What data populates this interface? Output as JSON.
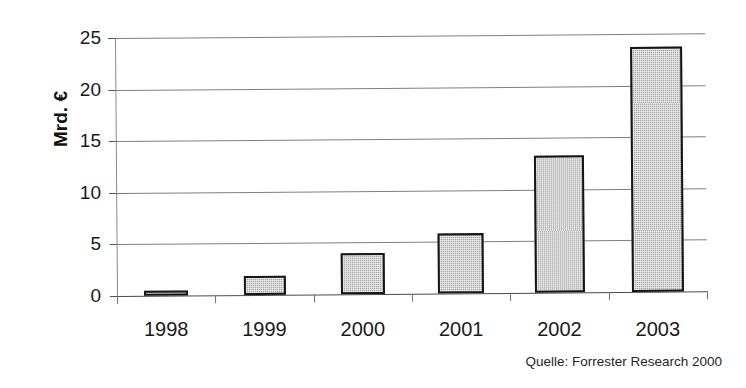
{
  "chart_data": {
    "type": "bar",
    "title": "",
    "subtitle": "",
    "xlabel": "",
    "ylabel": "Mrd. €",
    "categories": [
      "1998",
      "1999",
      "2000",
      "2001",
      "2002",
      "2003"
    ],
    "values": [
      0.5,
      1.8,
      4.0,
      5.8,
      13.3,
      23.7
    ],
    "series": [
      {
        "name": "",
        "values": [
          0.5,
          1.8,
          4.0,
          5.8,
          13.3,
          23.7
        ]
      }
    ],
    "ylim": [
      0,
      25
    ],
    "y_ticks": [
      0,
      5,
      10,
      15,
      20,
      25
    ],
    "y_tick_labels": [
      "0",
      "5",
      "10",
      "15",
      "20",
      "25"
    ],
    "grid": true,
    "grid_axis": "y",
    "legend": false,
    "legend_position": "none",
    "bar_fill_color": "#a9a9a9",
    "bar_edge_color": "#161616",
    "annotations": [
      "Quelle: Forrester Research 2000"
    ]
  },
  "axis": {
    "y_title": "Mrd. €",
    "y_tick_labels": [
      "0",
      "5",
      "10",
      "15",
      "20",
      "25"
    ],
    "x_tick_labels": [
      "1998",
      "1999",
      "2000",
      "2001",
      "2002",
      "2003"
    ]
  },
  "footer": {
    "source": "Quelle: Forrester Research 2000"
  }
}
